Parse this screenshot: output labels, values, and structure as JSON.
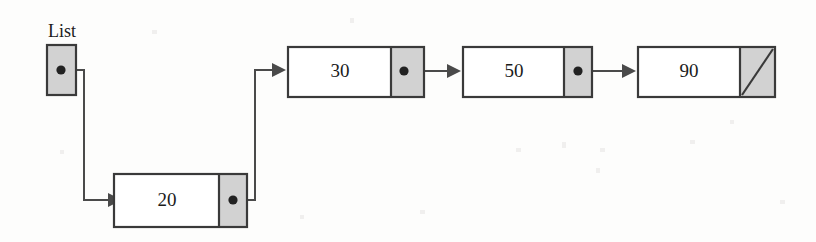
{
  "diagram": {
    "type": "linked-list",
    "colors": {
      "background": "#fdfdfc",
      "box_border": "#3a3a3a",
      "data_field": "#ffffff",
      "pointer_field": "#d2d2d2",
      "wire": "#4a4a4a",
      "dot": "#222222",
      "text": "#1b1b1b"
    },
    "head_pointer": {
      "label": "List",
      "name": "list-head-pointer",
      "has_dot": true
    },
    "nodes": [
      {
        "value": "20",
        "name": "node-20",
        "next": "node-30",
        "null_terminated": false
      },
      {
        "value": "30",
        "name": "node-30",
        "next": "node-50",
        "null_terminated": false
      },
      {
        "value": "50",
        "name": "node-50",
        "next": "node-90",
        "null_terminated": false
      },
      {
        "value": "90",
        "name": "node-90",
        "next": null,
        "null_terminated": true
      }
    ],
    "edges": [
      {
        "name": "edge-list-to-20",
        "from": "list-head-pointer",
        "to": "node-20",
        "routing": "right-down-right"
      },
      {
        "name": "edge-20-to-30",
        "from": "node-20",
        "to": "node-30",
        "routing": "right-up-right"
      },
      {
        "name": "edge-30-to-50",
        "from": "node-30",
        "to": "node-50",
        "routing": "horizontal"
      },
      {
        "name": "edge-50-to-90",
        "from": "node-50",
        "to": "node-90",
        "routing": "horizontal"
      }
    ]
  }
}
